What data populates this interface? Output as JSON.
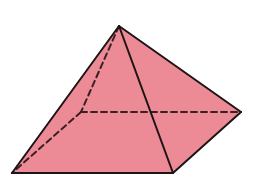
{
  "diagram": {
    "type": "square-pyramid",
    "fill_color": "#ec8b96",
    "edge_color": "#1e1416",
    "hidden_edge_color": "#3a2024",
    "vertices": {
      "apex": [
        119,
        26
      ],
      "front_left": [
        12,
        173
      ],
      "front_right": [
        173,
        173
      ],
      "back_right": [
        241,
        112
      ],
      "back_left": [
        81,
        112
      ]
    },
    "visible_edges": [
      [
        "apex",
        "front_left"
      ],
      [
        "apex",
        "front_right"
      ],
      [
        "apex",
        "back_right"
      ],
      [
        "front_left",
        "front_right"
      ],
      [
        "front_right",
        "back_right"
      ]
    ],
    "hidden_edges": [
      [
        "apex",
        "back_left"
      ],
      [
        "back_left",
        "front_left"
      ],
      [
        "back_left",
        "back_right"
      ]
    ]
  }
}
